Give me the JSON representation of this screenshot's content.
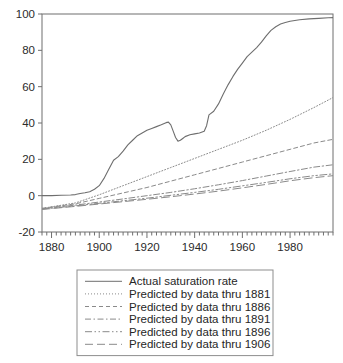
{
  "chart_data": {
    "type": "line",
    "title": "",
    "xlabel": "",
    "ylabel": "",
    "xlim": [
      1876,
      1998
    ],
    "ylim": [
      -20,
      100
    ],
    "grid": false,
    "legend_position": "below-plot",
    "x_ticks": [
      1880,
      1900,
      1920,
      1940,
      1960,
      1980
    ],
    "x_tick_labels": [
      "1880",
      "1900",
      "1920",
      "1940",
      "1960",
      "1980"
    ],
    "x_minor_tick_step": 2,
    "y_ticks": [
      -20,
      0,
      20,
      40,
      60,
      80,
      100
    ],
    "y_tick_labels": [
      "-20",
      "0",
      "20",
      "40",
      "60",
      "80",
      "100"
    ],
    "series": [
      {
        "name": "Actual saturation rate",
        "style": "solid",
        "color": "#6e6e6e",
        "x": [
          1876,
          1880,
          1884,
          1888,
          1890,
          1892,
          1894,
          1896,
          1898,
          1900,
          1902,
          1904,
          1906,
          1908,
          1910,
          1912,
          1914,
          1916,
          1918,
          1920,
          1922,
          1924,
          1926,
          1928,
          1929,
          1930,
          1931,
          1932,
          1933,
          1934,
          1935,
          1936,
          1938,
          1940,
          1942,
          1944,
          1945,
          1946,
          1948,
          1950,
          1952,
          1954,
          1956,
          1958,
          1960,
          1962,
          1964,
          1966,
          1968,
          1970,
          1972,
          1974,
          1976,
          1978,
          1980,
          1984,
          1988,
          1992,
          1996,
          1998
        ],
        "y": [
          0,
          0,
          0.2,
          0.4,
          0.6,
          1.2,
          1.6,
          2.2,
          3.5,
          5.5,
          9.5,
          14.5,
          19.5,
          21.5,
          24.5,
          28.0,
          30.5,
          33.0,
          34.5,
          36.0,
          37.0,
          38.0,
          39.0,
          40.2,
          40.5,
          39.0,
          35.5,
          32.0,
          30.0,
          30.5,
          31.5,
          32.5,
          33.5,
          34.0,
          34.5,
          35.5,
          38.5,
          44.5,
          46.5,
          50.5,
          56.0,
          61.0,
          65.5,
          69.5,
          73.0,
          76.5,
          79.0,
          81.5,
          84.5,
          88.0,
          91.0,
          93.0,
          94.5,
          95.3,
          96.0,
          96.8,
          97.3,
          97.6,
          97.9,
          98.0
        ]
      },
      {
        "name": "Predicted by data thru 1881",
        "style": "dotted",
        "color": "#8a8a8a",
        "x": [
          1876,
          1890,
          1900,
          1910,
          1920,
          1930,
          1940,
          1950,
          1960,
          1970,
          1980,
          1990,
          1998
        ],
        "y": [
          -7.0,
          -4.0,
          0.5,
          5.5,
          10.5,
          15.5,
          20.5,
          25.5,
          30.5,
          36.0,
          42.0,
          48.5,
          54.0
        ]
      },
      {
        "name": "Predicted by data thru 1886",
        "style": "dashed-short",
        "color": "#8a8a8a",
        "x": [
          1876,
          1890,
          1900,
          1910,
          1920,
          1930,
          1940,
          1950,
          1960,
          1970,
          1980,
          1990,
          1998
        ],
        "y": [
          -7.0,
          -4.5,
          -1.5,
          1.5,
          4.5,
          8.0,
          11.5,
          15.0,
          18.5,
          22.0,
          25.5,
          29.0,
          31.0
        ]
      },
      {
        "name": "Predicted by data thru 1891",
        "style": "dash-dot",
        "color": "#8a8a8a",
        "x": [
          1876,
          1890,
          1900,
          1910,
          1920,
          1930,
          1940,
          1950,
          1960,
          1970,
          1980,
          1990,
          1998
        ],
        "y": [
          -7.2,
          -5.2,
          -3.5,
          -1.8,
          0.0,
          1.8,
          3.8,
          6.0,
          8.3,
          10.8,
          13.3,
          15.7,
          17.0
        ]
      },
      {
        "name": "Predicted by data thru 1896",
        "style": "dash-dot-dot",
        "color": "#8a8a8a",
        "x": [
          1876,
          1890,
          1900,
          1910,
          1920,
          1930,
          1940,
          1950,
          1960,
          1970,
          1980,
          1990,
          1998
        ],
        "y": [
          -7.4,
          -5.6,
          -4.2,
          -2.8,
          -1.4,
          0.2,
          1.8,
          3.5,
          5.4,
          7.3,
          9.3,
          11.0,
          12.0
        ]
      },
      {
        "name": "Predicted by data thru 1906",
        "style": "dashed-long",
        "color": "#8a8a8a",
        "x": [
          1876,
          1890,
          1900,
          1910,
          1920,
          1930,
          1940,
          1950,
          1960,
          1970,
          1980,
          1990,
          1998
        ],
        "y": [
          -7.6,
          -5.9,
          -4.6,
          -3.3,
          -2.0,
          -0.6,
          0.9,
          2.5,
          4.3,
          6.2,
          8.2,
          9.9,
          11.0
        ]
      }
    ]
  },
  "legend": {
    "items": [
      {
        "label": "Actual saturation rate"
      },
      {
        "label": "Predicted by data thru 1881"
      },
      {
        "label": "Predicted by data thru 1886"
      },
      {
        "label": "Predicted by data thru 1891"
      },
      {
        "label": "Predicted by data thru 1896"
      },
      {
        "label": "Predicted by data thru 1906"
      }
    ]
  },
  "colors": {
    "axis": "#6f6f6f",
    "text": "#2b2b2b",
    "legend_border": "#8d8d8d",
    "plot_background": "#ffffff"
  }
}
